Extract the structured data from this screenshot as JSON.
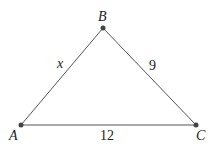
{
  "diagram": {
    "type": "triangle",
    "vertices": [
      {
        "name": "A",
        "x": 21,
        "y": 125
      },
      {
        "name": "B",
        "x": 103,
        "y": 28
      },
      {
        "name": "C",
        "x": 196,
        "y": 125
      }
    ],
    "sides": [
      {
        "from": "A",
        "to": "B",
        "label": "x"
      },
      {
        "from": "B",
        "to": "C",
        "label": "9"
      },
      {
        "from": "A",
        "to": "C",
        "label": "12"
      }
    ],
    "colors": {
      "line": "#555555",
      "point": "#444444",
      "text": "#222222"
    }
  }
}
